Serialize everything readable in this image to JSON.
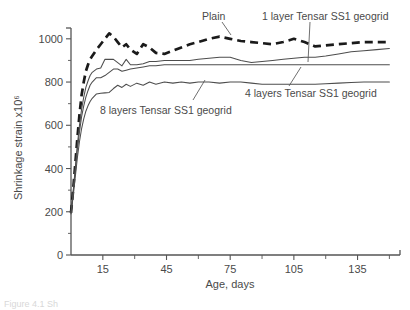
{
  "figure": {
    "caption_fragment": "Figure 4.1 Sh"
  },
  "chart_data": {
    "type": "line",
    "title": "",
    "xlabel": "Age, days",
    "ylabel": "Shrinkage strain x10⁶",
    "xlim": [
      0,
      155
    ],
    "ylim": [
      0,
      1050
    ],
    "xticks": [
      15,
      45,
      75,
      105,
      135
    ],
    "xticks_minor": [
      30,
      60,
      90,
      120,
      150
    ],
    "yticks": [
      0,
      200,
      400,
      600,
      800,
      1000
    ],
    "yticks_minor": [
      100,
      300,
      500,
      700,
      900
    ],
    "grid": false,
    "legend_position": "inline-annotations",
    "series": [
      {
        "name": "Plain",
        "style": "dashed",
        "label": "Plain",
        "x": [
          0,
          1,
          2,
          3,
          4,
          5,
          6,
          7,
          8,
          9,
          10,
          12,
          14,
          16,
          18,
          20,
          22,
          24,
          26,
          28,
          31,
          34,
          37,
          40,
          44,
          48,
          52,
          56,
          60,
          65,
          70,
          75,
          80,
          85,
          90,
          95,
          100,
          105,
          110,
          115,
          120,
          126,
          132,
          138,
          144,
          150
        ],
        "y": [
          195,
          300,
          420,
          540,
          650,
          740,
          800,
          850,
          880,
          905,
          920,
          950,
          975,
          1000,
          1025,
          1010,
          985,
          960,
          975,
          950,
          930,
          975,
          960,
          935,
          930,
          945,
          960,
          975,
          985,
          1000,
          1010,
          1000,
          990,
          985,
          980,
          975,
          985,
          1000,
          985,
          965,
          970,
          975,
          980,
          985,
          985,
          985
        ]
      },
      {
        "name": "1 layer Tensar SS1 geogrid",
        "style": "solid",
        "label": "1 layer Tensar SS1 geogrid",
        "x": [
          0,
          1,
          2,
          3,
          4,
          5,
          6,
          7,
          8,
          9,
          10,
          12,
          14,
          16,
          18,
          20,
          22,
          24,
          26,
          28,
          31,
          34,
          37,
          40,
          44,
          48,
          52,
          56,
          60,
          65,
          70,
          75,
          80,
          85,
          90,
          95,
          100,
          105,
          110,
          115,
          120,
          126,
          132,
          138,
          144,
          150
        ],
        "y": [
          195,
          290,
          400,
          510,
          600,
          675,
          730,
          775,
          805,
          830,
          845,
          860,
          865,
          905,
          905,
          905,
          890,
          875,
          905,
          880,
          880,
          885,
          895,
          895,
          900,
          900,
          900,
          900,
          905,
          910,
          915,
          915,
          900,
          890,
          895,
          900,
          905,
          910,
          915,
          915,
          920,
          930,
          940,
          945,
          950,
          955
        ]
      },
      {
        "name": "4 layers Tensar SS1 geogrid",
        "style": "solid",
        "label": "4 layers Tensar SS1 geogrid",
        "x": [
          0,
          1,
          2,
          3,
          4,
          5,
          6,
          7,
          8,
          9,
          10,
          12,
          14,
          16,
          18,
          20,
          22,
          24,
          26,
          28,
          31,
          34,
          37,
          40,
          44,
          48,
          52,
          56,
          60,
          65,
          70,
          75,
          80,
          85,
          90,
          95,
          100,
          105,
          110,
          115,
          120,
          126,
          132,
          138,
          144,
          150
        ],
        "y": [
          195,
          285,
          390,
          490,
          570,
          640,
          690,
          730,
          760,
          785,
          800,
          820,
          820,
          830,
          845,
          860,
          860,
          850,
          855,
          860,
          865,
          870,
          875,
          875,
          880,
          880,
          880,
          880,
          880,
          880,
          880,
          880,
          880,
          880,
          880,
          880,
          880,
          880,
          880,
          880,
          880,
          880,
          880,
          880,
          880,
          880
        ]
      },
      {
        "name": "8 layers Tensar SS1 geogrid",
        "style": "solid",
        "label": "8 layers Tensar SS1 geogrid",
        "x": [
          0,
          1,
          2,
          3,
          4,
          5,
          6,
          7,
          8,
          9,
          10,
          12,
          14,
          16,
          18,
          20,
          22,
          24,
          26,
          28,
          31,
          34,
          37,
          40,
          44,
          48,
          52,
          56,
          60,
          65,
          70,
          75,
          80,
          85,
          90,
          95,
          100,
          105,
          110,
          115,
          120,
          126,
          132,
          138,
          144,
          150
        ],
        "y": [
          190,
          270,
          360,
          450,
          525,
          585,
          630,
          665,
          690,
          710,
          725,
          745,
          748,
          750,
          752,
          770,
          785,
          775,
          790,
          780,
          795,
          785,
          800,
          790,
          800,
          795,
          800,
          795,
          800,
          800,
          795,
          800,
          800,
          795,
          790,
          790,
          790,
          790,
          790,
          790,
          792,
          795,
          798,
          800,
          800,
          800
        ]
      }
    ]
  }
}
